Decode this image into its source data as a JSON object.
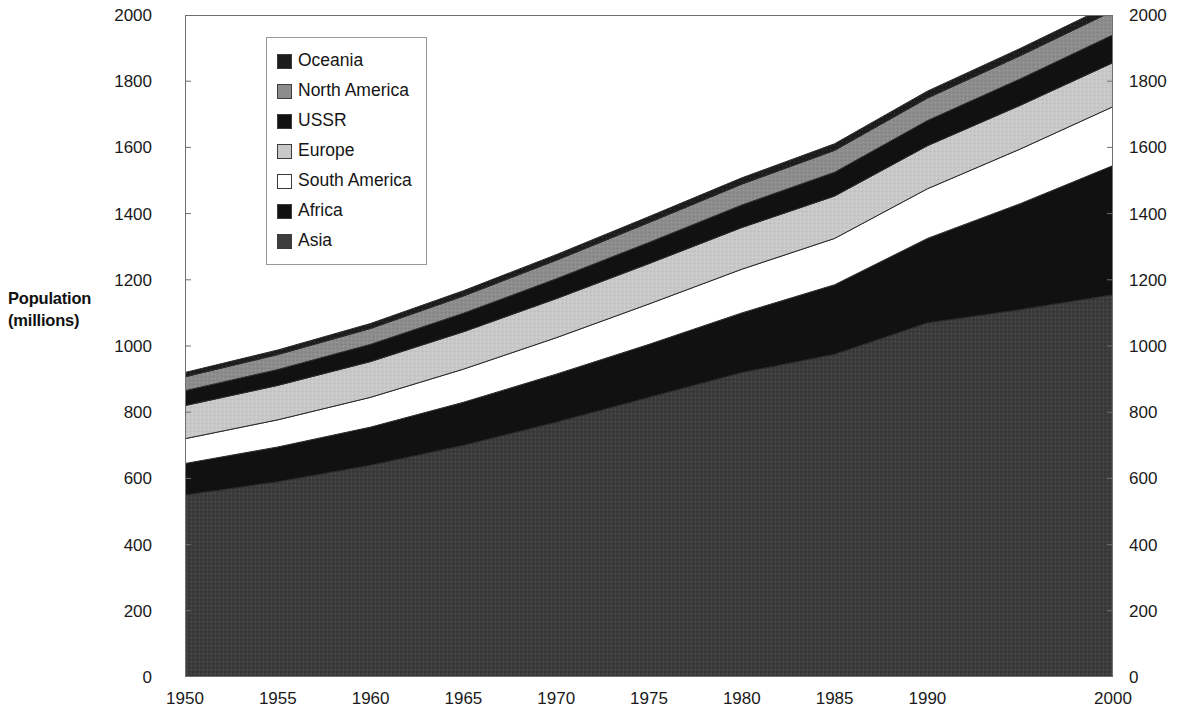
{
  "chart_data": {
    "type": "area",
    "stacked": true,
    "title": "",
    "xlabel": "",
    "ylabel": "Population\n(millions)",
    "ylabel_lines": [
      "Population",
      "(millions)"
    ],
    "x": [
      1950,
      1955,
      1960,
      1965,
      1970,
      1975,
      1980,
      1985,
      1990,
      1995,
      2000
    ],
    "xlim": [
      1950,
      2000
    ],
    "ylim": [
      0,
      2000
    ],
    "xticks": [
      "1950",
      "1955",
      "1960",
      "1965",
      "1970",
      "1975",
      "1980",
      "1985",
      "1990",
      "1995",
      "2000"
    ],
    "xticks_shown": [
      "1950",
      "1955",
      "1960",
      "1965",
      "1970",
      "1975",
      "1980",
      "1985",
      "1990",
      "2000"
    ],
    "yticks": [
      "0",
      "200",
      "400",
      "600",
      "800",
      "1000",
      "1200",
      "1400",
      "1600",
      "1800",
      "2000"
    ],
    "yticks_right": [
      "0",
      "200",
      "400",
      "600",
      "800",
      "1000",
      "1200",
      "1400",
      "1600",
      "1800",
      "2000"
    ],
    "grid": false,
    "legend_position": "top-left-inside",
    "legend_order_top_to_bottom": [
      "Oceania",
      "North America",
      "USSR",
      "Europe",
      "South America",
      "Africa",
      "Asia"
    ],
    "stack_order_bottom_to_top": [
      "Asia",
      "Africa",
      "South America",
      "Europe",
      "USSR",
      "North America",
      "Oceania"
    ],
    "series": [
      {
        "name": "Asia",
        "color": "#3d3d3d",
        "values": [
          550,
          590,
          640,
          700,
          770,
          845,
          920,
          975,
          1070,
          1110,
          1155
        ]
      },
      {
        "name": "Africa",
        "color": "#111111",
        "values": [
          95,
          105,
          115,
          130,
          145,
          160,
          180,
          210,
          255,
          320,
          390
        ]
      },
      {
        "name": "South America",
        "color": "#ffffff",
        "values": [
          75,
          82,
          90,
          100,
          110,
          122,
          132,
          140,
          150,
          165,
          178
        ]
      },
      {
        "name": "Europe",
        "color": "#c8c8c8",
        "values": [
          100,
          104,
          108,
          113,
          118,
          122,
          126,
          128,
          130,
          132,
          133
        ]
      },
      {
        "name": "USSR",
        "color": "#111111",
        "values": [
          45,
          48,
          52,
          56,
          60,
          64,
          68,
          72,
          76,
          80,
          84
        ]
      },
      {
        "name": "North America",
        "color": "#8c8c8c",
        "values": [
          42,
          45,
          48,
          52,
          56,
          60,
          63,
          66,
          68,
          70,
          72
        ]
      },
      {
        "name": "Oceania",
        "color": "#1c1c1c",
        "values": [
          13,
          14,
          15,
          16,
          17,
          18,
          19,
          20,
          21,
          22,
          23
        ]
      }
    ],
    "totals": [
      920,
      988,
      1068,
      1167,
      1276,
      1391,
      1508,
      1611,
      1770,
      1899,
      2035
    ]
  },
  "axis": {
    "y_title_line1": "Population",
    "y_title_line2": "(millions)"
  },
  "legend": {
    "items": [
      {
        "label": "Oceania",
        "color": "#1c1c1c",
        "pattern": "solid-dark"
      },
      {
        "label": "North America",
        "color": "#8c8c8c",
        "pattern": "solid-mid"
      },
      {
        "label": "USSR",
        "color": "#111111",
        "pattern": "solid-black"
      },
      {
        "label": "Europe",
        "color": "#c8c8c8",
        "pattern": "solid-light"
      },
      {
        "label": "South America",
        "color": "#ffffff",
        "pattern": "empty"
      },
      {
        "label": "Africa",
        "color": "#111111",
        "pattern": "solid-black"
      },
      {
        "label": "Asia",
        "color": "#3d3d3d",
        "pattern": "texture-dark"
      }
    ]
  }
}
